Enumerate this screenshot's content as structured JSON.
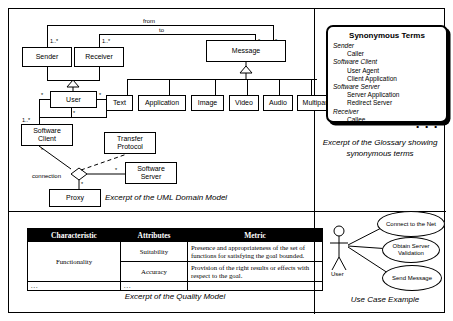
{
  "figure": {
    "panels": {
      "domain_model_caption": "Excerpt of the UML Domain Model",
      "glossary_caption_line1": "Excerpt of the Glossary showing",
      "glossary_caption_line2": "synonymous terms",
      "quality_model_caption": "Excerpt of the Quality Model",
      "use_case_caption": "Use Case Example"
    }
  },
  "domain_model": {
    "classes": {
      "sender": "Sender",
      "receiver": "Receiver",
      "message": "Message",
      "user": "User",
      "software_client_l1": "Software",
      "software_client_l2": "Client",
      "transfer_protocol_l1": "Transfer",
      "transfer_protocol_l2": "Protocol",
      "software_server_l1": "Software",
      "software_server_l2": "Server",
      "proxy": "Proxy"
    },
    "message_subtypes": [
      "Text",
      "Application",
      "Image",
      "Video",
      "Audio",
      "Multipart"
    ],
    "associations": {
      "from": "from",
      "to": "to",
      "connection": "connection"
    },
    "multiplicities": {
      "sender_to_message": "1..*",
      "receiver_to_message": "1..*",
      "message_from": "*",
      "message_to": "*",
      "user_left": "*",
      "user_right": "*",
      "user_self": "*",
      "user_to_client": "1..*",
      "client_to_connection": "*",
      "server_to_connection": "*",
      "proxy_to_connection": "*"
    }
  },
  "glossary": {
    "title": "Synonymous Terms",
    "entries": [
      {
        "term": "Sender",
        "synonyms": [
          "Caller"
        ]
      },
      {
        "term": "Software Client",
        "synonyms": [
          "User Agent",
          "Client Application"
        ]
      },
      {
        "term": "Software Server",
        "synonyms": [
          "Server Application",
          "Redirect Server"
        ]
      },
      {
        "term": "Receiver",
        "synonyms": [
          "Callee"
        ]
      }
    ],
    "more_indicator": "• • •"
  },
  "quality_model": {
    "headers": [
      "Characteristic",
      "Attributes",
      "Metric"
    ],
    "rows": [
      {
        "characteristic": "Functionality",
        "attributes": "Suitability",
        "metric": "Presence and appropriateness of the set of functions for satisfying the goal bounded."
      },
      {
        "characteristic": "",
        "attributes": "Accuracy",
        "metric": "Provision of the right results or effects with respect to the goal."
      }
    ],
    "continuation": {
      "characteristic": "...",
      "attributes": "...",
      "metric": ""
    }
  },
  "use_case": {
    "actor_label": "User",
    "use_cases": [
      "Connect to the Net",
      "Obtain Server Validation",
      "Send Message"
    ]
  }
}
